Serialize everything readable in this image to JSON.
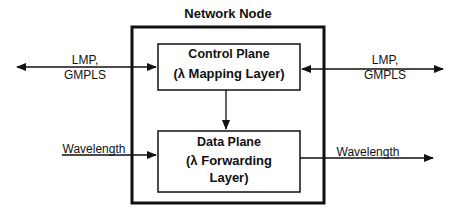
{
  "diagram": {
    "title": "Network Node",
    "control_plane": {
      "line1": "Control Plane",
      "line2": "(λ Mapping Layer)"
    },
    "data_plane": {
      "line1": "Data Plane",
      "line2": "(λ Forwarding",
      "line3": "Layer)"
    },
    "left_signal": {
      "line1": "LMP,",
      "line2": "GMPLS"
    },
    "right_signal": {
      "line1": "LMP,",
      "line2": "GMPLS"
    },
    "left_data": "Wavelength",
    "right_data": "Wavelength"
  }
}
